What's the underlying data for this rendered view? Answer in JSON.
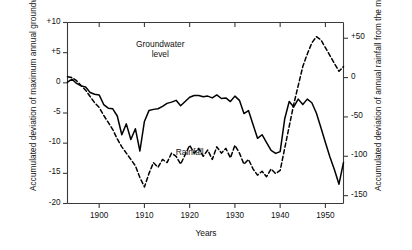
{
  "chart_data": {
    "type": "line",
    "title": "",
    "xlabel": "Years",
    "ylabel_left": "Accumulated deviation of maximum annual groundwater level (meters)",
    "ylabel_right": "Accumulated deviation of annual rainfall from the mean (cm)",
    "xlim": [
      1893,
      1954
    ],
    "ylim_left": [
      -20,
      10
    ],
    "ylim_right": [
      -160,
      70
    ],
    "grid": false,
    "legend": "inline-annotations",
    "xticks": [
      1900,
      1910,
      1920,
      1930,
      1940,
      1950
    ],
    "xtick_labels": [
      "1900",
      "1910",
      "1920",
      "1930",
      "1940",
      "1950"
    ],
    "yticks_left": [
      10,
      5,
      0,
      -5,
      -10,
      -15,
      -20
    ],
    "ytick_labels_left": [
      "+10",
      "+5",
      "0",
      "-5",
      "-10",
      "-15",
      "-20"
    ],
    "yticks_right": [
      50,
      0,
      -50,
      -100,
      -150
    ],
    "ytick_labels_right": [
      "+50",
      "0",
      "-50",
      "-100",
      "-150"
    ],
    "annotations": [
      {
        "name": "groundwater-level-label",
        "text_line1": "Groundwater",
        "text_line2": "level",
        "x": 1913.5,
        "y": 6.2
      },
      {
        "name": "rainfall-label",
        "text": "Rainfall",
        "x": 1920.0,
        "y": -11.6
      }
    ],
    "series": [
      {
        "name": "Groundwater level",
        "axis": "left",
        "units": "meters",
        "style": "solid",
        "color": "#000000",
        "x": [
          1893,
          1894,
          1895,
          1896,
          1897,
          1898,
          1899,
          1900,
          1901,
          1902,
          1903,
          1904,
          1905,
          1906,
          1907,
          1908,
          1909,
          1910,
          1911,
          1912,
          1913,
          1914,
          1915,
          1916,
          1917,
          1918,
          1919,
          1920,
          1921,
          1922,
          1923,
          1924,
          1925,
          1926,
          1927,
          1928,
          1929,
          1930,
          1931,
          1932,
          1933,
          1934,
          1935,
          1936,
          1937,
          1938,
          1939,
          1940,
          1941,
          1942,
          1943,
          1944,
          1945,
          1946,
          1947,
          1948,
          1949,
          1950,
          1951,
          1952,
          1953,
          1954
        ],
        "y": [
          0.1,
          0.6,
          -0.1,
          -0.5,
          -0.7,
          -1.6,
          -1.9,
          -2.0,
          -3.6,
          -4.2,
          -4.3,
          -5.5,
          -8.6,
          -6.8,
          -9.4,
          -7.6,
          -11.3,
          -6.4,
          -4.6,
          -4.4,
          -4.3,
          -3.9,
          -3.4,
          -3.2,
          -2.9,
          -3.8,
          -3.1,
          -2.4,
          -2.1,
          -2.1,
          -2.3,
          -2.2,
          -2.5,
          -2.0,
          -2.6,
          -2.5,
          -3.1,
          -2.2,
          -2.9,
          -5.1,
          -4.6,
          -6.9,
          -9.2,
          -8.6,
          -9.9,
          -11.2,
          -11.7,
          -11.4,
          -6.0,
          -3.1,
          -4.0,
          -2.7,
          -3.6,
          -2.7,
          -3.3,
          -5.0,
          -7.4,
          -9.9,
          -12.3,
          -14.4,
          -16.8,
          -13.2
        ]
      },
      {
        "name": "Rainfall",
        "axis": "right",
        "units": "cm",
        "style": "dashed",
        "color": "#000000",
        "x": [
          1893,
          1894,
          1895,
          1896,
          1897,
          1898,
          1899,
          1900,
          1901,
          1902,
          1903,
          1904,
          1905,
          1906,
          1907,
          1908,
          1909,
          1910,
          1911,
          1912,
          1913,
          1914,
          1915,
          1916,
          1917,
          1918,
          1919,
          1920,
          1921,
          1922,
          1923,
          1924,
          1925,
          1926,
          1927,
          1928,
          1929,
          1930,
          1931,
          1932,
          1933,
          1934,
          1935,
          1936,
          1937,
          1938,
          1939,
          1940,
          1941,
          1942,
          1943,
          1944,
          1945,
          1946,
          1947,
          1948,
          1949,
          1950,
          1951,
          1952,
          1953,
          1954
        ],
        "y": [
          1,
          0,
          -4,
          -10,
          -16,
          -24,
          -32,
          -38,
          -48,
          -57,
          -66,
          -78,
          -88,
          -96,
          -104,
          -112,
          -127,
          -139,
          -122,
          -108,
          -114,
          -104,
          -108,
          -96,
          -100,
          -110,
          -98,
          -86,
          -96,
          -90,
          -100,
          -92,
          -104,
          -88,
          -96,
          -90,
          -102,
          -86,
          -96,
          -110,
          -104,
          -116,
          -124,
          -119,
          -126,
          -116,
          -122,
          -118,
          -90,
          -62,
          -34,
          -10,
          14,
          30,
          44,
          52,
          48,
          38,
          28,
          18,
          8,
          14
        ]
      }
    ]
  },
  "axes": {
    "left": {
      "ticks": [
        {
          "label": "+10",
          "value": 10
        },
        {
          "label": "+5",
          "value": 5
        },
        {
          "label": "0",
          "value": 0
        },
        {
          "label": "-5",
          "value": -5
        },
        {
          "label": "-10",
          "value": -10
        },
        {
          "label": "-15",
          "value": -15
        },
        {
          "label": "-20",
          "value": -20
        }
      ],
      "title": "Accumulated deviation of maximum annual groundwater level (meters)"
    },
    "right": {
      "ticks": [
        {
          "label": "+50",
          "value": 50
        },
        {
          "label": "0",
          "value": 0
        },
        {
          "label": "-50",
          "value": -50
        },
        {
          "label": "-100",
          "value": -100
        },
        {
          "label": "-150",
          "value": -150
        }
      ],
      "title": "Accumulated deviation of annual rainfall from the mean (cm)"
    },
    "bottom": {
      "ticks": [
        {
          "label": "1900",
          "value": 1900
        },
        {
          "label": "1910",
          "value": 1910
        },
        {
          "label": "1920",
          "value": 1920
        },
        {
          "label": "1930",
          "value": 1930
        },
        {
          "label": "1940",
          "value": 1940
        },
        {
          "label": "1950",
          "value": 1950
        }
      ],
      "title": "Years"
    }
  },
  "colors": {
    "line": "#000000",
    "axis": "#3a3a3a",
    "background": "#ffffff"
  }
}
